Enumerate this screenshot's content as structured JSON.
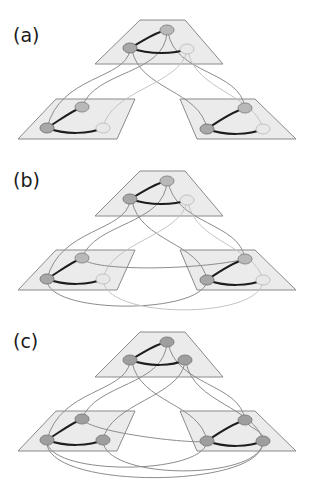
{
  "figure": {
    "panels": [
      {
        "id": "a",
        "label": "(a)",
        "description": "Three-layer network, top layer connected to two lower layers"
      },
      {
        "id": "b",
        "label": "(b)",
        "description": "Three-layer network with additional inter-layer links between the lower layers"
      },
      {
        "id": "c",
        "label": "(c)",
        "description": "Three-layer network with all nodes fully interconnected across layers"
      }
    ]
  },
  "colors": {
    "plane_fill": "#ebebeb",
    "plane_stroke": "#8a8a8a",
    "intra_edge": "#1c1c1c",
    "inter_edge": "#8c8c8c",
    "inter_edge_light": "#c4c4c4",
    "node_dark": "#a8a8a8",
    "node_light": "#e8e8e8"
  }
}
